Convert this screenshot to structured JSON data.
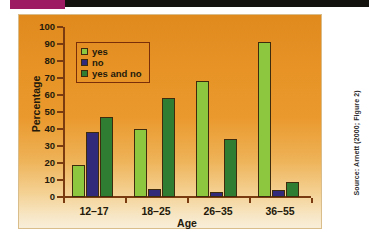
{
  "figure": {
    "source_credit": "Source: Arnett (2000; Figure 2)"
  },
  "decoration": {
    "magenta_bar_color": "#9c1b63",
    "black_bar_color": "#14120f"
  },
  "chart_data": {
    "type": "bar",
    "title": "",
    "xlabel": "Age",
    "ylabel": "Percentage",
    "categories": [
      "12–17",
      "18–25",
      "26–35",
      "36–55"
    ],
    "series": [
      {
        "name": "yes",
        "color": "#8dc63f",
        "values": [
          19,
          40,
          68,
          91
        ]
      },
      {
        "name": "no",
        "color": "#312a7a",
        "values": [
          38,
          5,
          3,
          4
        ]
      },
      {
        "name": "yes and no",
        "color": "#2e7d32",
        "values": [
          47,
          58,
          34,
          9
        ]
      }
    ],
    "ylim": [
      0,
      100
    ],
    "yticks": [
      0,
      10,
      20,
      30,
      40,
      50,
      60,
      70,
      80,
      90,
      100
    ],
    "ytick_labels": [
      "0",
      "10",
      "20",
      "30",
      "40",
      "50",
      "60",
      "70",
      "80",
      "90",
      "100"
    ],
    "grid": false,
    "legend_position": "upper-left",
    "plot_background": "orange gradient fading to cream"
  }
}
